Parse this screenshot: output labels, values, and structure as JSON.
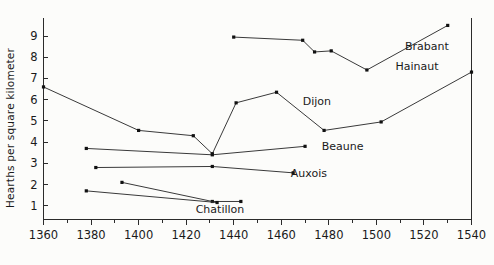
{
  "chart_data": {
    "type": "line",
    "title": "",
    "xlabel": "",
    "ylabel": "Hearths per square kilometer",
    "xlim": [
      1360,
      1540
    ],
    "ylim": [
      0.35,
      9.85
    ],
    "grid": false,
    "legend": "inline-series-labels",
    "xticks": [
      1360,
      1380,
      1400,
      1420,
      1440,
      1460,
      1480,
      1500,
      1520,
      1540
    ],
    "xtick_labels": [
      "1360",
      "1380",
      "1400",
      "1420",
      "1440",
      "1460",
      "1480",
      "1500",
      "1520",
      "1540"
    ],
    "xminor_ticks": [
      1370,
      1390,
      1410,
      1430,
      1450,
      1470,
      1490,
      1510,
      1530
    ],
    "yticks": [
      1,
      2,
      3,
      4,
      5,
      6,
      7,
      8,
      9
    ],
    "ytick_labels": [
      "1",
      "2",
      "3",
      "4",
      "5",
      "6",
      "7",
      "8",
      "9"
    ],
    "series": [
      {
        "name": "Brabant",
        "label": "Brabant",
        "label_x": 1512,
        "label_y": 8.55,
        "points": [
          {
            "x": 1440,
            "y": 8.95
          },
          {
            "x": 1469,
            "y": 8.8
          },
          {
            "x": 1474,
            "y": 8.25
          },
          {
            "x": 1481,
            "y": 8.3
          },
          {
            "x": 1496,
            "y": 7.4
          },
          {
            "x": 1530,
            "y": 9.5
          }
        ]
      },
      {
        "name": "Hainaut",
        "label": "Hainaut",
        "label_x": 1508,
        "label_y": 7.6,
        "points": [
          {
            "x": 1360,
            "y": 6.6
          },
          {
            "x": 1400,
            "y": 4.55
          },
          {
            "x": 1423,
            "y": 4.3
          },
          {
            "x": 1431,
            "y": 3.45
          },
          {
            "x": 1441,
            "y": 5.85
          },
          {
            "x": 1458,
            "y": 6.35
          },
          {
            "x": 1478,
            "y": 4.55
          },
          {
            "x": 1502,
            "y": 4.95
          },
          {
            "x": 1540,
            "y": 7.3
          }
        ]
      },
      {
        "name": "Dijon",
        "label": "Dijon",
        "label_x": 1469,
        "label_y": 5.95,
        "points": [
          {
            "x": 1378,
            "y": 3.7
          },
          {
            "x": 1431,
            "y": 3.4
          },
          {
            "x": 1470,
            "y": 3.8
          }
        ]
      },
      {
        "name": "Beaune",
        "label": "Beaune",
        "label_x": 1477,
        "label_y": 3.8,
        "points": [
          {
            "x": 1382,
            "y": 2.8
          },
          {
            "x": 1431,
            "y": 2.85
          },
          {
            "x": 1465,
            "y": 2.55
          }
        ]
      },
      {
        "name": "Auxois",
        "label": "Auxois",
        "label_x": 1464,
        "label_y": 2.55,
        "points": [
          {
            "x": 1393,
            "y": 2.1
          },
          {
            "x": 1431,
            "y": 1.2
          },
          {
            "x": 1443,
            "y": 1.2
          }
        ]
      },
      {
        "name": "Chatillon",
        "label": "Chatillon",
        "label_x": 1424,
        "label_y": 0.85,
        "points": [
          {
            "x": 1378,
            "y": 1.7
          },
          {
            "x": 1433,
            "y": 1.15
          }
        ]
      }
    ],
    "colors": {
      "line": "#3a3a3a",
      "point": "#111111",
      "axis": "#2b2b2b",
      "text": "#1a1a1a",
      "background": "#fcfcfa"
    }
  }
}
